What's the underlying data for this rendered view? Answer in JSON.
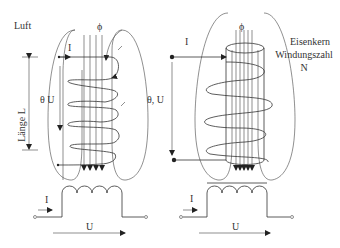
{
  "left_coil": {
    "medium_label": "Luft",
    "flux_label": "ϕ",
    "current_label": "I",
    "theta_u_label": "θ  U",
    "length_label": "Länge L"
  },
  "right_coil": {
    "flux_label": "ϕ",
    "current_label": "I",
    "theta_u_label": "θ, U",
    "core_label": "Eisenkern",
    "turns_label": "Windungszahl",
    "turns_symbol": "N"
  },
  "left_symbol": {
    "current_label": "I",
    "voltage_label": "U"
  },
  "right_symbol": {
    "current_label": "I",
    "voltage_label": "U"
  },
  "colors": {
    "line": "#333333",
    "background": "#ffffff"
  }
}
